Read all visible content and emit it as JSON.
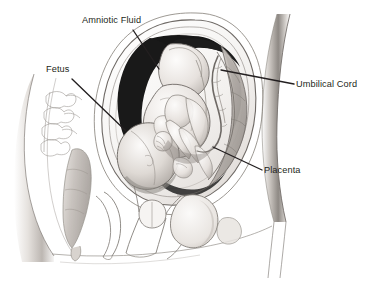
{
  "figure": {
    "background_color": "#ffffff",
    "ink_color": "#231f20",
    "amniotic_fill": "#1a1a1a",
    "tissue_light": "#f2f0ee",
    "tissue_mid": "#cfcac6",
    "tissue_shadow": "#9c9792"
  },
  "labels": {
    "amniotic_fluid": "Amniotic Fluid",
    "fetus": "Fetus",
    "umbilical_cord": "Umbilical Cord",
    "placenta": "Placenta"
  },
  "leaders": {
    "amniotic_fluid": {
      "x1": 133,
      "y1": 30,
      "x2": 159,
      "y2": 69
    },
    "fetus": {
      "x1": 72,
      "y1": 79,
      "x2": 126,
      "y2": 131
    },
    "umbilical_cord": {
      "x1": 221,
      "y1": 70,
      "x2": 294,
      "y2": 84
    },
    "placenta": {
      "x1": 213,
      "y1": 147,
      "x2": 262,
      "y2": 170
    }
  }
}
